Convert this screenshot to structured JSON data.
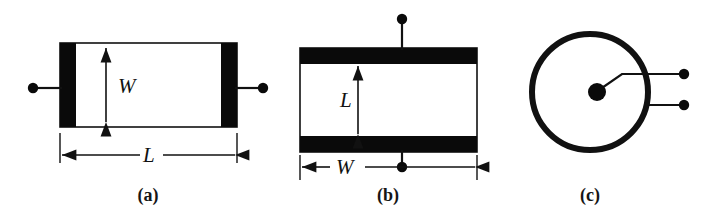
{
  "figure": {
    "background_color": "#ffffff",
    "ink_color": "#111111",
    "electrode_color": "#0a0a0a",
    "panels": [
      {
        "id": "a",
        "caption": "(a)",
        "shape": "rectangle-with-end-electrodes",
        "dimension_labels": [
          {
            "name": "width-label",
            "text": "W",
            "orientation": "vertical"
          },
          {
            "name": "length-label",
            "text": "L",
            "orientation": "horizontal"
          }
        ],
        "terminals": 2,
        "electrode_placement": "left-and-right-ends"
      },
      {
        "id": "b",
        "caption": "(b)",
        "shape": "rectangle-with-top-bottom-electrodes",
        "dimension_labels": [
          {
            "name": "length-label",
            "text": "L",
            "orientation": "vertical"
          },
          {
            "name": "width-label",
            "text": "W",
            "orientation": "horizontal"
          }
        ],
        "terminals": 2,
        "electrode_placement": "top-and-bottom-edges"
      },
      {
        "id": "c",
        "caption": "(c)",
        "shape": "circle-with-center-electrode",
        "dimension_labels": [],
        "terminals": 2,
        "electrode_placement": "center-dot-and-outer-ring"
      }
    ]
  }
}
